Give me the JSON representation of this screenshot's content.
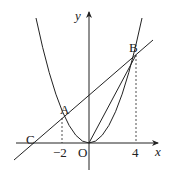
{
  "diagram": {
    "type": "coordinate-geometry",
    "labels": {
      "y_axis": "y",
      "x_axis": "x",
      "origin": "O",
      "point_a": "A",
      "point_b": "B",
      "point_c": "C",
      "tick_neg2": "−2",
      "tick_4": "4"
    },
    "curves": [
      "parabola through O, A, B",
      "line through C, A, B",
      "segment OB"
    ],
    "colors": {
      "stroke": "#222222",
      "background": "#ffffff"
    }
  }
}
